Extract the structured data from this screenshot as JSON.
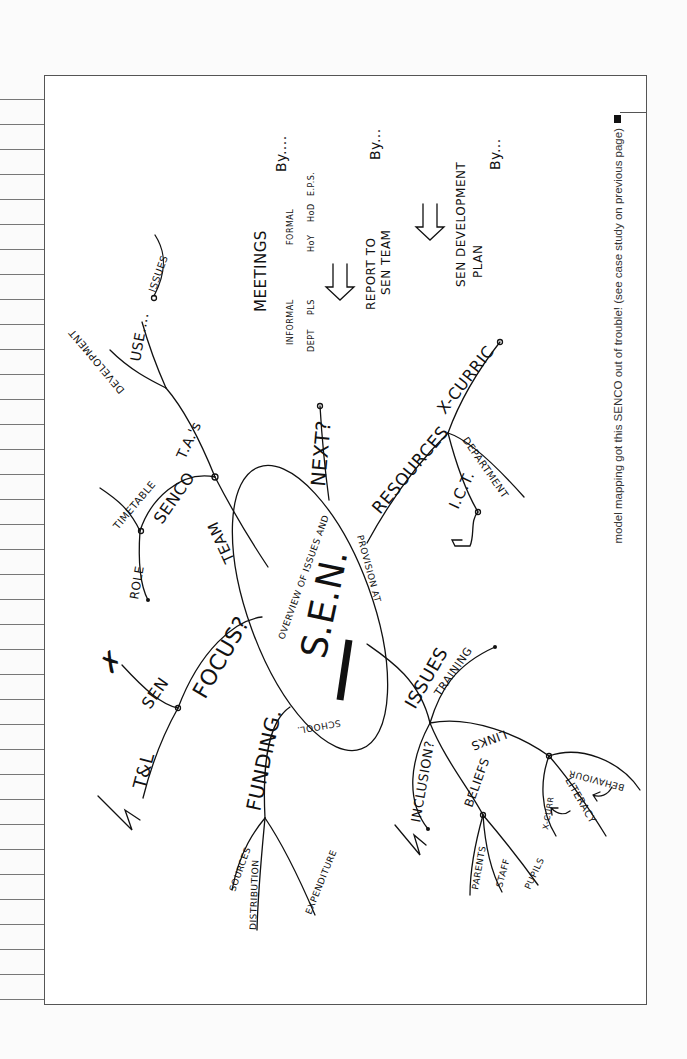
{
  "page": {
    "caption": "model mapping got this SENCO out of trouble! (see case study on previous page)",
    "background_color": "#fbfbfb",
    "ink_color": "#111111"
  },
  "mindmap": {
    "center": {
      "title": "S.E.N.",
      "ring_text_1": "OVERVIEW OF ISSUES AND",
      "ring_text_2": "PROVISION AT",
      "ring_text_3": "SCHOOL.",
      "redacted": true
    },
    "branches": {
      "focus": {
        "label": "FOCUS?",
        "children": [
          "SEN",
          "T&L"
        ],
        "marks": {
          "sen": "✗",
          "tl": "✓"
        }
      },
      "team": {
        "label": "TEAM",
        "senco": {
          "label": "SENCO",
          "children": [
            "TIMETABLE",
            "ROLE"
          ]
        },
        "tas": {
          "label": "T.A.'s",
          "children": [
            "DEVELOPMENT",
            "USE....",
            "ISSUES"
          ]
        }
      },
      "next": {
        "label": "NEXT?",
        "plan": {
          "meetings": "MEETINGS",
          "informal": "INFORMAL",
          "formal": "FORMAL",
          "informal_children": [
            "DEPT",
            "PLS"
          ],
          "formal_children": [
            "HoY",
            "HoD",
            "E.P.S."
          ],
          "by_1": "By....",
          "report": "REPORT TO",
          "report_2": "SEN TEAM",
          "by_2": "By...",
          "dev_plan": "SEN DEVELOPMENT",
          "dev_plan_2": "PLAN",
          "by_3": "By..."
        }
      },
      "resources": {
        "label": "RESOURCES",
        "children": [
          "X-CURRIC",
          "DEPARTMENT",
          "I.C.T."
        ]
      },
      "funding": {
        "label": "FUNDING.",
        "children": [
          "SOURCES",
          "DISTRIBUTION",
          "EXPENDITURE"
        ]
      },
      "issues": {
        "label": "ISSUES",
        "inclusion": "INCLUSION?",
        "training": "TRAINING",
        "beliefs": {
          "label": "BELIEFS",
          "children": [
            "PARENTS",
            "STAFF",
            "PUPILS"
          ]
        },
        "links": {
          "label": "LINKS",
          "children": [
            "X-CURR",
            "LITERACY",
            "BEHAVIOUR"
          ]
        },
        "marks": {
          "inclusion": "✓"
        }
      }
    }
  }
}
